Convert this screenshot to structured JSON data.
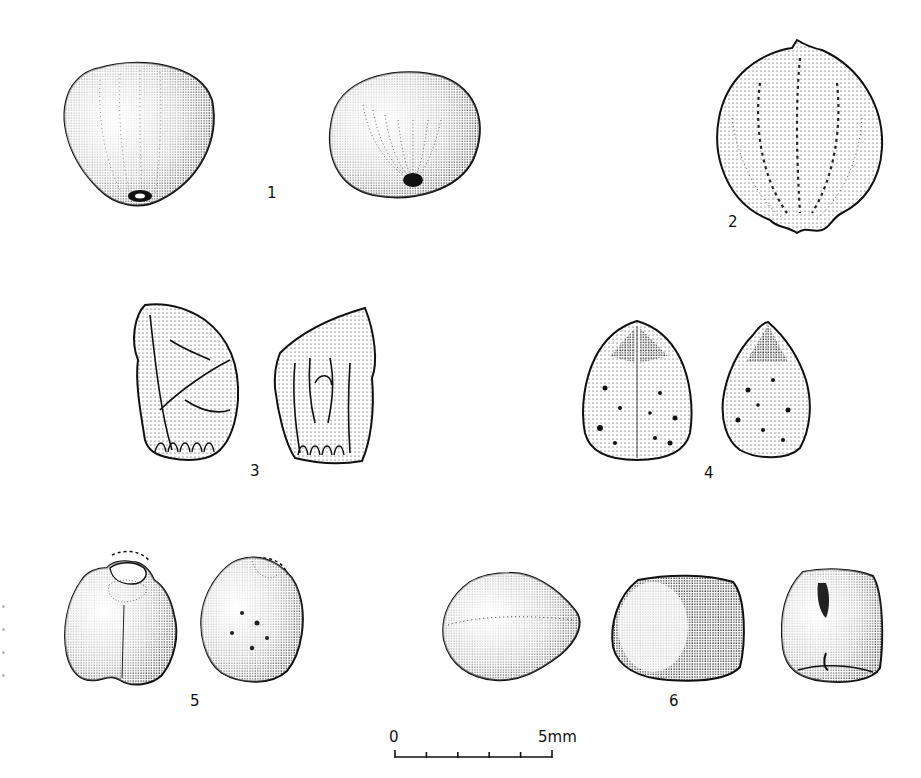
{
  "plate": {
    "background": "#ffffff",
    "ink": "#111111",
    "figures": [
      {
        "number": "1",
        "label": "1",
        "views": 2,
        "description": "rounded smooth seed with hilum scar, two views"
      },
      {
        "number": "2",
        "label": "2",
        "views": 1,
        "description": "ovate ridged seed with pointed apex"
      },
      {
        "number": "3",
        "label": "3",
        "views": 2,
        "description": "irregular angular fragment with veined surface, two views"
      },
      {
        "number": "4",
        "label": "4",
        "views": 2,
        "description": "ovoid tuberculate seed with pointed apex, two views"
      },
      {
        "number": "5",
        "label": "5",
        "views": 2,
        "description": "rounded seed with broken apex (dashed outline), two views"
      },
      {
        "number": "6",
        "label": "6",
        "views": 3,
        "description": "smooth rounded grain, three views"
      }
    ]
  },
  "scale_bar": {
    "start_label": "0",
    "end_label": "5mm",
    "ticks": 6,
    "length_mm": 5
  }
}
